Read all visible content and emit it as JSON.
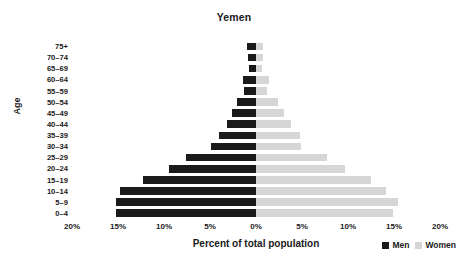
{
  "chart_data": {
    "type": "bar",
    "subtype": "population-pyramid",
    "title": "Yemen",
    "xlabel": "Percent of total population",
    "ylabel": "Age",
    "grid": false,
    "legend_position": "bottom-right",
    "xlim": [
      -20,
      20
    ],
    "x_ticks": [
      "20%",
      "15%",
      "10%",
      "5%",
      "0%",
      "5%",
      "10%",
      "15%",
      "20%"
    ],
    "x_tick_values": [
      -20,
      -15,
      -10,
      -5,
      0,
      5,
      10,
      15,
      20
    ],
    "categories": [
      "75+",
      "70–74",
      "65–69",
      "60–64",
      "55–59",
      "50–54",
      "45–49",
      "40–44",
      "35–39",
      "30–34",
      "25–29",
      "20–24",
      "15–19",
      "10–14",
      "5–9",
      "0–4"
    ],
    "series": [
      {
        "name": "Men",
        "color": "#1a1a1a",
        "side": "left",
        "values": [
          1.0,
          0.9,
          0.8,
          1.4,
          1.3,
          2.1,
          2.6,
          3.2,
          4.0,
          4.9,
          7.6,
          9.5,
          12.3,
          14.8,
          15.2,
          15.2
        ]
      },
      {
        "name": "Women",
        "color": "#d6d6d6",
        "side": "right",
        "values": [
          0.8,
          0.8,
          0.7,
          1.4,
          1.2,
          2.4,
          3.0,
          3.8,
          4.8,
          4.9,
          7.7,
          9.7,
          12.5,
          14.1,
          15.4,
          14.9
        ]
      }
    ]
  },
  "legend": {
    "men_label": "Men",
    "women_label": "Women"
  }
}
